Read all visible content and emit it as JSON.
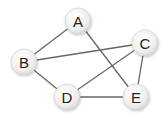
{
  "graph": {
    "nodes": [
      {
        "id": "A",
        "label": "A",
        "x": 78,
        "y": 21
      },
      {
        "id": "B",
        "label": "B",
        "x": 24,
        "y": 62
      },
      {
        "id": "C",
        "label": "C",
        "x": 145,
        "y": 43
      },
      {
        "id": "D",
        "label": "D",
        "x": 67,
        "y": 97
      },
      {
        "id": "E",
        "label": "E",
        "x": 136,
        "y": 97
      }
    ],
    "edges": [
      [
        "A",
        "B"
      ],
      [
        "A",
        "E"
      ],
      [
        "B",
        "C"
      ],
      [
        "B",
        "D"
      ],
      [
        "C",
        "D"
      ],
      [
        "C",
        "E"
      ],
      [
        "D",
        "E"
      ]
    ],
    "node_radius": 13,
    "edge_color": "#666666",
    "node_fill": "#f2f2f2",
    "node_stroke": "#cccccc"
  }
}
